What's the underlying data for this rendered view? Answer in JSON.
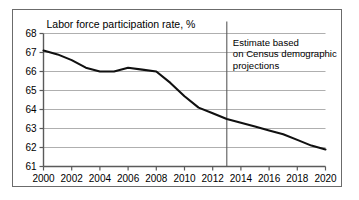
{
  "figure": {
    "title": "Labor force participation rate, %",
    "annotation_lines": [
      "Estimate based",
      "on Census demographic",
      "projections"
    ],
    "divider_year": 2013,
    "colors": {
      "line": "#101010",
      "grid": "#9a9a9a",
      "axis": "#5a5a5a",
      "border": "#6b6b6b",
      "background": "#ffffff",
      "text": "#000000"
    }
  },
  "chart_data": {
    "type": "line",
    "title": "Labor force participation rate, %",
    "xlabel": "",
    "ylabel": "",
    "xlim": [
      2000,
      2020
    ],
    "ylim": [
      61,
      68
    ],
    "grid": true,
    "legend": null,
    "xticks": [
      2000,
      2002,
      2004,
      2006,
      2008,
      2010,
      2012,
      2014,
      2016,
      2018,
      2020
    ],
    "yticks": [
      61,
      62,
      63,
      64,
      65,
      66,
      67,
      68
    ],
    "x": [
      2000,
      2001,
      2002,
      2003,
      2004,
      2005,
      2006,
      2007,
      2008,
      2009,
      2010,
      2011,
      2012,
      2013,
      2014,
      2015,
      2016,
      2017,
      2018,
      2019,
      2020
    ],
    "values": [
      67.1,
      66.9,
      66.6,
      66.2,
      66.0,
      66.0,
      66.2,
      66.1,
      66.0,
      65.4,
      64.7,
      64.1,
      63.8,
      63.5,
      63.3,
      63.1,
      62.9,
      62.7,
      62.4,
      62.1,
      61.9
    ],
    "series": [
      {
        "name": "Labor force participation rate",
        "values": [
          67.1,
          66.9,
          66.6,
          66.2,
          66.0,
          66.0,
          66.2,
          66.1,
          66.0,
          65.4,
          64.7,
          64.1,
          63.8,
          63.5,
          63.3,
          63.1,
          62.9,
          62.7,
          62.4,
          62.1,
          61.9
        ]
      }
    ],
    "annotations": [
      {
        "text": "Estimate based on Census demographic projections",
        "x": 2013,
        "type": "vertical-divider-label"
      }
    ]
  }
}
